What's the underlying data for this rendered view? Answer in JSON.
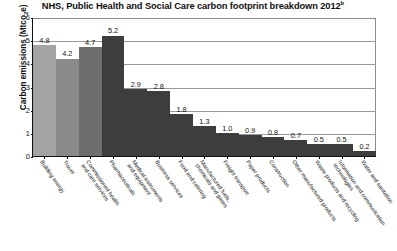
{
  "chart_data": {
    "type": "bar",
    "title": "NHS, Public Health and Social Care carbon footprint breakdown 2012",
    "title_superscript": "b",
    "xlabel": "",
    "ylabel": "Carbon emissions (Mtco",
    "ylabel_sub": "2",
    "ylabel_end": "e)",
    "ylim": [
      0,
      6
    ],
    "yticks": [
      "0",
      "1",
      "2",
      "3",
      "4",
      "5",
      "6"
    ],
    "grid": true,
    "legend": "none",
    "categories": [
      "Building energy",
      "Travel",
      "Commissioned health\nand care services",
      "Pharmaceuticals",
      "Medical instruments\nand equipment",
      "Business services",
      "Food and catering",
      "Manufactured fuels,\nchemicals and gases",
      "Freight transport",
      "Paper products",
      "Construction",
      "Other manufactured products",
      "Waste products and recycling",
      "Information and communication\ntechnologies",
      "Water and sanitation"
    ],
    "values": [
      4.8,
      4.2,
      4.7,
      5.2,
      2.9,
      2.8,
      1.8,
      1.3,
      1.0,
      0.9,
      0.8,
      0.7,
      0.5,
      0.5,
      0.2
    ],
    "value_labels": [
      "4.8",
      "4.2",
      "4.7",
      "5.2",
      "2.9",
      "2.8",
      "1.8",
      "1.3",
      "1.0",
      "0.9",
      "0.8",
      "0.7",
      "0.5",
      "0.5",
      "0.2"
    ],
    "bar_colors": [
      "#a3a3a3",
      "#8a8a8a",
      "#6e6e6e",
      "#3d3d3d",
      "#3d3d3d",
      "#3d3d3d",
      "#3d3d3d",
      "#3d3d3d",
      "#3d3d3d",
      "#3d3d3d",
      "#3d3d3d",
      "#3d3d3d",
      "#3d3d3d",
      "#3d3d3d",
      "#3d3d3d"
    ],
    "axis_color": "#111111",
    "grid_color": "#9a9a9a",
    "background": "#ffffff"
  }
}
